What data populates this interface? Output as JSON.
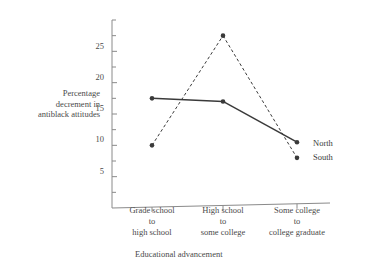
{
  "chart_data": {
    "type": "line",
    "title": "",
    "xlabel": "Educational advancement",
    "ylabel": "Percentage decrement in antiblack attitudes",
    "ylabel_lines": [
      "Percentage",
      "decrement in",
      "antiblack attitudes"
    ],
    "categories": [
      "Grade school to high school",
      "High school to some college",
      "Some college to college graduate"
    ],
    "category_lines": [
      [
        "Grade school",
        "to",
        "high school"
      ],
      [
        "High school",
        "to",
        "some college"
      ],
      [
        "Some college",
        "to",
        "college graduate"
      ]
    ],
    "series": [
      {
        "name": "North",
        "values": [
          17.5,
          17.0,
          10.5
        ],
        "linestyle": "solid",
        "marker": "filled-circle",
        "color": "#3a3a3a"
      },
      {
        "name": "South",
        "values": [
          10.0,
          27.5,
          8.0
        ],
        "linestyle": "dashed",
        "marker": "filled-circle",
        "color": "#3a3a3a"
      }
    ],
    "ylim": [
      0,
      30
    ],
    "ytick_labels": [
      "5",
      "10",
      "15",
      "20",
      "25"
    ],
    "ytick_values": [
      5,
      10,
      15,
      20,
      25
    ],
    "yminor_tick_values": [
      2.5,
      7.5,
      12.5,
      17.5,
      22.5,
      27.5,
      30
    ],
    "grid": false,
    "legend_position": "right-inline",
    "axis_color": "#8a8a8a"
  },
  "labels": {
    "north": "North",
    "south": "South"
  }
}
